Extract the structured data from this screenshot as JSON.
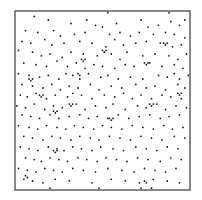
{
  "chart_data": {
    "type": "scatter",
    "title": "",
    "xlabel": "",
    "ylabel": "",
    "xlim": [
      0,
      1
    ],
    "ylim": [
      0,
      1
    ],
    "grid": false,
    "legend": null,
    "axes_ticks": false,
    "frame": {
      "left": 15,
      "top": 11,
      "width": 175,
      "height": 179,
      "color": "#555555"
    },
    "point_color": "#1a1a1a",
    "point_radius": 0.9,
    "series": [
      {
        "name": "points",
        "coords_note": "x,y normalized to frame; y measured from top",
        "points": [
          [
            0.53,
            0.01
          ],
          [
            0.88,
            0.01
          ],
          [
            0.11,
            0.03
          ],
          [
            0.19,
            0.05
          ],
          [
            0.32,
            0.07
          ],
          [
            0.41,
            0.05
          ],
          [
            0.46,
            0.08
          ],
          [
            0.5,
            0.09
          ],
          [
            0.58,
            0.07
          ],
          [
            0.72,
            0.05
          ],
          [
            0.76,
            0.09
          ],
          [
            0.82,
            0.08
          ],
          [
            0.89,
            0.06
          ],
          [
            0.94,
            0.08
          ],
          [
            0.97,
            0.05
          ],
          [
            0.06,
            0.11
          ],
          [
            0.13,
            0.12
          ],
          [
            0.22,
            0.11
          ],
          [
            0.26,
            0.14
          ],
          [
            0.34,
            0.13
          ],
          [
            0.4,
            0.12
          ],
          [
            0.54,
            0.13
          ],
          [
            0.6,
            0.12
          ],
          [
            0.66,
            0.14
          ],
          [
            0.71,
            0.12
          ],
          [
            0.79,
            0.13
          ],
          [
            0.86,
            0.12
          ],
          [
            0.91,
            0.13
          ],
          [
            0.97,
            0.15
          ],
          [
            0.04,
            0.17
          ],
          [
            0.09,
            0.18
          ],
          [
            0.17,
            0.16
          ],
          [
            0.21,
            0.19
          ],
          [
            0.28,
            0.18
          ],
          [
            0.37,
            0.17
          ],
          [
            0.44,
            0.18
          ],
          [
            0.52,
            0.2
          ],
          [
            0.57,
            0.16
          ],
          [
            0.62,
            0.19
          ],
          [
            0.69,
            0.18
          ],
          [
            0.75,
            0.17
          ],
          [
            0.83,
            0.18
          ],
          [
            0.9,
            0.2
          ],
          [
            0.95,
            0.19
          ],
          [
            0.02,
            0.22
          ],
          [
            0.1,
            0.23
          ],
          [
            0.15,
            0.25
          ],
          [
            0.2,
            0.24
          ],
          [
            0.27,
            0.26
          ],
          [
            0.32,
            0.23
          ],
          [
            0.39,
            0.24
          ],
          [
            0.47,
            0.25
          ],
          [
            0.55,
            0.24
          ],
          [
            0.6,
            0.27
          ],
          [
            0.64,
            0.23
          ],
          [
            0.73,
            0.25
          ],
          [
            0.8,
            0.24
          ],
          [
            0.88,
            0.25
          ],
          [
            0.93,
            0.27
          ],
          [
            0.98,
            0.24
          ],
          [
            0.05,
            0.29
          ],
          [
            0.12,
            0.3
          ],
          [
            0.18,
            0.31
          ],
          [
            0.24,
            0.28
          ],
          [
            0.3,
            0.31
          ],
          [
            0.35,
            0.29
          ],
          [
            0.4,
            0.32
          ],
          [
            0.45,
            0.3
          ],
          [
            0.5,
            0.31
          ],
          [
            0.57,
            0.32
          ],
          [
            0.63,
            0.3
          ],
          [
            0.68,
            0.31
          ],
          [
            0.77,
            0.29
          ],
          [
            0.84,
            0.31
          ],
          [
            0.91,
            0.3
          ],
          [
            0.96,
            0.32
          ],
          [
            0.02,
            0.35
          ],
          [
            0.08,
            0.36
          ],
          [
            0.14,
            0.37
          ],
          [
            0.19,
            0.36
          ],
          [
            0.25,
            0.38
          ],
          [
            0.29,
            0.35
          ],
          [
            0.33,
            0.36
          ],
          [
            0.37,
            0.38
          ],
          [
            0.42,
            0.35
          ],
          [
            0.49,
            0.37
          ],
          [
            0.53,
            0.36
          ],
          [
            0.59,
            0.38
          ],
          [
            0.66,
            0.37
          ],
          [
            0.73,
            0.38
          ],
          [
            0.82,
            0.36
          ],
          [
            0.87,
            0.37
          ],
          [
            0.91,
            0.35
          ],
          [
            0.94,
            0.38
          ],
          [
            0.99,
            0.36
          ],
          [
            0.04,
            0.41
          ],
          [
            0.1,
            0.42
          ],
          [
            0.16,
            0.43
          ],
          [
            0.21,
            0.41
          ],
          [
            0.26,
            0.44
          ],
          [
            0.31,
            0.42
          ],
          [
            0.36,
            0.43
          ],
          [
            0.43,
            0.41
          ],
          [
            0.48,
            0.44
          ],
          [
            0.55,
            0.42
          ],
          [
            0.61,
            0.43
          ],
          [
            0.69,
            0.41
          ],
          [
            0.75,
            0.43
          ],
          [
            0.8,
            0.42
          ],
          [
            0.86,
            0.44
          ],
          [
            0.93,
            0.41
          ],
          [
            0.97,
            0.43
          ],
          [
            0.03,
            0.47
          ],
          [
            0.07,
            0.48
          ],
          [
            0.12,
            0.46
          ],
          [
            0.18,
            0.49
          ],
          [
            0.23,
            0.47
          ],
          [
            0.3,
            0.48
          ],
          [
            0.33,
            0.46
          ],
          [
            0.38,
            0.47
          ],
          [
            0.44,
            0.49
          ],
          [
            0.51,
            0.47
          ],
          [
            0.57,
            0.48
          ],
          [
            0.62,
            0.46
          ],
          [
            0.67,
            0.49
          ],
          [
            0.72,
            0.47
          ],
          [
            0.78,
            0.49
          ],
          [
            0.84,
            0.47
          ],
          [
            0.89,
            0.48
          ],
          [
            0.95,
            0.49
          ],
          [
            0.01,
            0.53
          ],
          [
            0.06,
            0.54
          ],
          [
            0.11,
            0.52
          ],
          [
            0.17,
            0.55
          ],
          [
            0.22,
            0.53
          ],
          [
            0.27,
            0.54
          ],
          [
            0.35,
            0.52
          ],
          [
            0.4,
            0.55
          ],
          [
            0.46,
            0.53
          ],
          [
            0.52,
            0.54
          ],
          [
            0.56,
            0.52
          ],
          [
            0.63,
            0.55
          ],
          [
            0.7,
            0.53
          ],
          [
            0.75,
            0.54
          ],
          [
            0.81,
            0.52
          ],
          [
            0.86,
            0.55
          ],
          [
            0.92,
            0.53
          ],
          [
            0.98,
            0.54
          ],
          [
            0.04,
            0.58
          ],
          [
            0.09,
            0.59
          ],
          [
            0.14,
            0.6
          ],
          [
            0.2,
            0.58
          ],
          [
            0.25,
            0.6
          ],
          [
            0.31,
            0.59
          ],
          [
            0.37,
            0.58
          ],
          [
            0.42,
            0.6
          ],
          [
            0.47,
            0.59
          ],
          [
            0.53,
            0.6
          ],
          [
            0.59,
            0.58
          ],
          [
            0.65,
            0.6
          ],
          [
            0.71,
            0.59
          ],
          [
            0.77,
            0.58
          ],
          [
            0.83,
            0.6
          ],
          [
            0.88,
            0.59
          ],
          [
            0.94,
            0.58
          ],
          [
            0.02,
            0.64
          ],
          [
            0.08,
            0.65
          ],
          [
            0.13,
            0.66
          ],
          [
            0.18,
            0.64
          ],
          [
            0.24,
            0.65
          ],
          [
            0.29,
            0.66
          ],
          [
            0.34,
            0.64
          ],
          [
            0.39,
            0.65
          ],
          [
            0.45,
            0.66
          ],
          [
            0.5,
            0.64
          ],
          [
            0.55,
            0.65
          ],
          [
            0.61,
            0.66
          ],
          [
            0.67,
            0.64
          ],
          [
            0.73,
            0.65
          ],
          [
            0.79,
            0.66
          ],
          [
            0.85,
            0.64
          ],
          [
            0.9,
            0.66
          ],
          [
            0.96,
            0.65
          ],
          [
            0.05,
            0.7
          ],
          [
            0.1,
            0.71
          ],
          [
            0.16,
            0.72
          ],
          [
            0.21,
            0.7
          ],
          [
            0.26,
            0.71
          ],
          [
            0.32,
            0.72
          ],
          [
            0.37,
            0.7
          ],
          [
            0.43,
            0.71
          ],
          [
            0.48,
            0.72
          ],
          [
            0.54,
            0.7
          ],
          [
            0.6,
            0.71
          ],
          [
            0.66,
            0.72
          ],
          [
            0.72,
            0.7
          ],
          [
            0.78,
            0.71
          ],
          [
            0.84,
            0.72
          ],
          [
            0.91,
            0.7
          ],
          [
            0.97,
            0.71
          ],
          [
            0.03,
            0.76
          ],
          [
            0.08,
            0.77
          ],
          [
            0.13,
            0.78
          ],
          [
            0.19,
            0.76
          ],
          [
            0.24,
            0.77
          ],
          [
            0.28,
            0.78
          ],
          [
            0.33,
            0.76
          ],
          [
            0.38,
            0.77
          ],
          [
            0.44,
            0.78
          ],
          [
            0.49,
            0.76
          ],
          [
            0.56,
            0.77
          ],
          [
            0.62,
            0.78
          ],
          [
            0.69,
            0.76
          ],
          [
            0.75,
            0.77
          ],
          [
            0.81,
            0.78
          ],
          [
            0.87,
            0.76
          ],
          [
            0.93,
            0.77
          ],
          [
            0.06,
            0.82
          ],
          [
            0.11,
            0.83
          ],
          [
            0.15,
            0.84
          ],
          [
            0.2,
            0.82
          ],
          [
            0.25,
            0.83
          ],
          [
            0.3,
            0.84
          ],
          [
            0.36,
            0.82
          ],
          [
            0.41,
            0.83
          ],
          [
            0.47,
            0.84
          ],
          [
            0.52,
            0.82
          ],
          [
            0.58,
            0.83
          ],
          [
            0.64,
            0.84
          ],
          [
            0.7,
            0.82
          ],
          [
            0.76,
            0.83
          ],
          [
            0.83,
            0.84
          ],
          [
            0.89,
            0.82
          ],
          [
            0.95,
            0.83
          ],
          [
            0.02,
            0.88
          ],
          [
            0.07,
            0.89
          ],
          [
            0.12,
            0.9
          ],
          [
            0.17,
            0.88
          ],
          [
            0.22,
            0.89
          ],
          [
            0.27,
            0.9
          ],
          [
            0.33,
            0.88
          ],
          [
            0.39,
            0.89
          ],
          [
            0.46,
            0.9
          ],
          [
            0.53,
            0.88
          ],
          [
            0.61,
            0.89
          ],
          [
            0.68,
            0.9
          ],
          [
            0.74,
            0.88
          ],
          [
            0.8,
            0.89
          ],
          [
            0.86,
            0.9
          ],
          [
            0.92,
            0.88
          ],
          [
            0.05,
            0.94
          ],
          [
            0.1,
            0.95
          ],
          [
            0.16,
            0.96
          ],
          [
            0.23,
            0.94
          ],
          [
            0.31,
            0.95
          ],
          [
            0.44,
            0.96
          ],
          [
            0.55,
            0.94
          ],
          [
            0.63,
            0.95
          ],
          [
            0.71,
            0.96
          ],
          [
            0.79,
            0.94
          ],
          [
            0.87,
            0.95
          ],
          [
            0.94,
            0.96
          ],
          [
            0.2,
            0.99
          ],
          [
            0.48,
            0.99
          ],
          [
            0.72,
            0.99
          ],
          [
            0.78,
            0.99
          ]
        ],
        "clusters": [
          [
            0.14,
            0.47
          ],
          [
            0.15,
            0.48
          ],
          [
            0.16,
            0.47
          ],
          [
            0.38,
            0.27
          ],
          [
            0.39,
            0.28
          ],
          [
            0.4,
            0.27
          ],
          [
            0.77,
            0.52
          ],
          [
            0.78,
            0.53
          ],
          [
            0.79,
            0.52
          ],
          [
            0.5,
            0.22
          ],
          [
            0.51,
            0.23
          ],
          [
            0.52,
            0.22
          ],
          [
            0.54,
            0.6
          ],
          [
            0.55,
            0.61
          ],
          [
            0.56,
            0.6
          ],
          [
            0.22,
            0.56
          ],
          [
            0.23,
            0.57
          ],
          [
            0.24,
            0.56
          ],
          [
            0.74,
            0.29
          ],
          [
            0.75,
            0.3
          ],
          [
            0.76,
            0.29
          ],
          [
            0.93,
            0.46
          ],
          [
            0.94,
            0.47
          ],
          [
            0.95,
            0.46
          ],
          [
            0.22,
            0.78
          ],
          [
            0.23,
            0.79
          ],
          [
            0.24,
            0.78
          ],
          [
            0.31,
            0.52
          ],
          [
            0.32,
            0.53
          ],
          [
            0.33,
            0.52
          ],
          [
            0.85,
            0.18
          ],
          [
            0.86,
            0.19
          ],
          [
            0.87,
            0.18
          ],
          [
            0.08,
            0.38
          ],
          [
            0.09,
            0.39
          ],
          [
            0.1,
            0.38
          ],
          [
            0.74,
            0.95
          ],
          [
            0.75,
            0.96
          ],
          [
            0.06,
            0.92
          ],
          [
            0.07,
            0.93
          ],
          [
            0.36,
            0.35
          ],
          [
            0.37,
            0.36
          ]
        ]
      }
    ]
  }
}
